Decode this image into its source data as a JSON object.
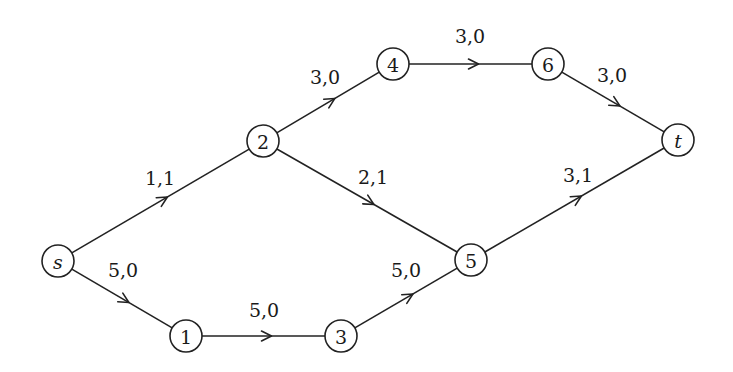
{
  "diagram": {
    "type": "flow-network",
    "nodes": [
      {
        "id": "s",
        "label": "s",
        "italic": true,
        "x": 58,
        "y": 261
      },
      {
        "id": "1",
        "label": "1",
        "italic": false,
        "x": 186,
        "y": 336
      },
      {
        "id": "3",
        "label": "3",
        "italic": false,
        "x": 341,
        "y": 336
      },
      {
        "id": "5",
        "label": "5",
        "italic": false,
        "x": 471,
        "y": 260
      },
      {
        "id": "2",
        "label": "2",
        "italic": false,
        "x": 263,
        "y": 141
      },
      {
        "id": "4",
        "label": "4",
        "italic": false,
        "x": 393,
        "y": 64
      },
      {
        "id": "6",
        "label": "6",
        "italic": false,
        "x": 548,
        "y": 64
      },
      {
        "id": "t",
        "label": "t",
        "italic": true,
        "x": 678,
        "y": 140
      }
    ],
    "edges": [
      {
        "from": "s",
        "to": "2",
        "label": "1,1",
        "capacity": 1,
        "flow": 1,
        "lx": 160,
        "ly": 178
      },
      {
        "from": "s",
        "to": "1",
        "label": "5,0",
        "capacity": 5,
        "flow": 0,
        "lx": 123,
        "ly": 270
      },
      {
        "from": "1",
        "to": "3",
        "label": "5,0",
        "capacity": 5,
        "flow": 0,
        "lx": 264,
        "ly": 310
      },
      {
        "from": "3",
        "to": "5",
        "label": "5,0",
        "capacity": 5,
        "flow": 0,
        "lx": 406,
        "ly": 270
      },
      {
        "from": "2",
        "to": "4",
        "label": "3,0",
        "capacity": 3,
        "flow": 0,
        "lx": 325,
        "ly": 77
      },
      {
        "from": "2",
        "to": "5",
        "label": "2,1",
        "capacity": 2,
        "flow": 1,
        "lx": 373,
        "ly": 177
      },
      {
        "from": "4",
        "to": "6",
        "label": "3,0",
        "capacity": 3,
        "flow": 0,
        "lx": 470,
        "ly": 36
      },
      {
        "from": "6",
        "to": "t",
        "label": "3,0",
        "capacity": 3,
        "flow": 0,
        "lx": 612,
        "ly": 75
      },
      {
        "from": "5",
        "to": "t",
        "label": "3,1",
        "capacity": 3,
        "flow": 1,
        "lx": 578,
        "ly": 175
      }
    ],
    "node_radius": 16,
    "stroke_color": "#222222",
    "background": "#ffffff"
  }
}
